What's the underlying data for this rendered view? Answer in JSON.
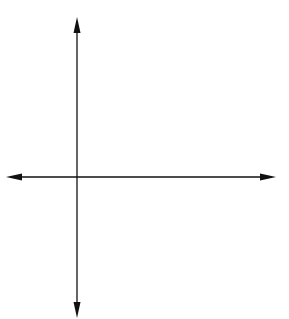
{
  "chart_data": {
    "type": "scatter",
    "title": "",
    "xlabel": "x",
    "ylabel": "y",
    "xlim": [
      -2.7,
      7.6
    ],
    "ylim": [
      -5.6,
      6.6
    ],
    "grid": true,
    "x_ticks": [
      "-2",
      "-1",
      "0",
      "1",
      "2",
      "3",
      "4",
      "5",
      "6",
      "7"
    ],
    "y_ticks": [
      "6",
      "5",
      "4",
      "3",
      "2",
      "1",
      "-1",
      "-2",
      "-3",
      "-4",
      "-5"
    ],
    "series": [
      {
        "name": "Triangle ABC",
        "shape": "polygon",
        "points": [
          {
            "label": "A",
            "x": 1,
            "y": 2
          },
          {
            "label": "B",
            "x": 2,
            "y": 4
          },
          {
            "label": "C",
            "x": 3,
            "y": 1
          }
        ]
      },
      {
        "name": "Triangle A'B'C'",
        "shape": "polygon",
        "points": [
          {
            "label": "A′",
            "x": 4,
            "y": -2
          },
          {
            "label": "B′",
            "x": 5,
            "y": -4
          },
          {
            "label": "C′",
            "x": 6,
            "y": -1
          }
        ]
      }
    ]
  },
  "axes": {
    "x_name": "x",
    "y_name": "y",
    "origin_label": "0"
  },
  "colors": {
    "grid": "#b8b8b8",
    "axis": "#111111",
    "shape": "#222222"
  }
}
